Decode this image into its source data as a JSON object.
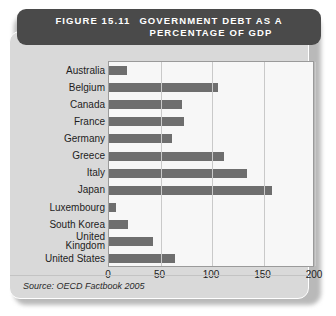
{
  "figure": {
    "number": "FIGURE 15.11",
    "title_line1": "GOVERNMENT DEBT AS A",
    "title_line2": "PERCENTAGE OF GDP",
    "source": "Source: OECD Factbook 2005",
    "header_color": "#4a4a4a",
    "card_color": "#d9d9d9",
    "bar_color": "#6e6e6e",
    "plot_background": "#f7f7f7"
  },
  "chart_data": {
    "type": "bar",
    "orientation": "horizontal",
    "title": "GOVERNMENT DEBT AS A PERCENTAGE OF GDP",
    "xlabel": "",
    "ylabel": "",
    "xlim": [
      0,
      200
    ],
    "xticks": [
      0,
      50,
      100,
      150,
      200
    ],
    "grid": true,
    "legend": false,
    "categories": [
      "Australia",
      "Belgium",
      "Canada",
      "France",
      "Germany",
      "Greece",
      "Italy",
      "Japan",
      "Luxembourg",
      "South Korea",
      "United Kingdom",
      "United States"
    ],
    "category_labels": [
      [
        "Australia"
      ],
      [
        "Belgium"
      ],
      [
        "Canada"
      ],
      [
        "France"
      ],
      [
        "Germany"
      ],
      [
        "Greece"
      ],
      [
        "Italy"
      ],
      [
        "Japan"
      ],
      [
        "Luxembourg"
      ],
      [
        "South Korea"
      ],
      [
        "United",
        "Kingdom"
      ],
      [
        "United States"
      ]
    ],
    "values": [
      17,
      106,
      71,
      73,
      61,
      112,
      134,
      158,
      7,
      18,
      43,
      64
    ],
    "source": "Source: OECD Factbook 2005"
  }
}
